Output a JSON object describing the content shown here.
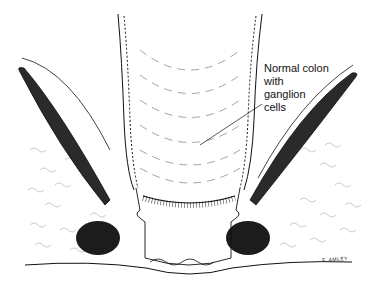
{
  "figure": {
    "type": "medical-illustration",
    "annotations": [
      {
        "id": "normal-colon",
        "text": "Normal colon\nwith\nganglion\ncells"
      }
    ],
    "signature": "F. AMLEY",
    "colors": {
      "ink": "#111111",
      "background": "#ffffff",
      "muscle": "#2a2a2a"
    }
  }
}
